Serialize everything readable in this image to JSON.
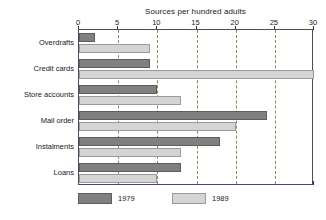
{
  "chart_data": {
    "type": "bar",
    "orientation": "horizontal",
    "title": "Sources per hundred adults",
    "xlabel": "",
    "ylabel": "",
    "xlim": [
      0,
      30
    ],
    "xticks": [
      0,
      5,
      10,
      15,
      20,
      25,
      30
    ],
    "xtick_labels": [
      "0",
      "5",
      "10",
      "15",
      "20",
      "25",
      "30"
    ],
    "grid": "vertical-dashed",
    "legend_position": "bottom-left",
    "categories": [
      "Overdrafts",
      "Credit cards",
      "Store accounts",
      "Mail order",
      "Instalments",
      "Loans"
    ],
    "series": [
      {
        "name": "1979",
        "color": "#808080",
        "values": [
          2,
          9,
          10,
          24,
          18,
          13
        ]
      },
      {
        "name": "1989",
        "color": "#d4d4d4",
        "values": [
          9,
          30,
          13,
          20,
          13,
          10
        ]
      }
    ]
  },
  "legend": {
    "items": [
      {
        "label": "1979",
        "swatch": "dark-gray-swatch"
      },
      {
        "label": "1989",
        "swatch": "light-gray-swatch"
      }
    ]
  },
  "colors": {
    "series_1979": "#808080",
    "series_1989": "#d4d4d4",
    "frame": "#4a4a6a",
    "gridline": "#8a8a5a",
    "background": "#ffffff",
    "text": "#1a1a1a"
  }
}
